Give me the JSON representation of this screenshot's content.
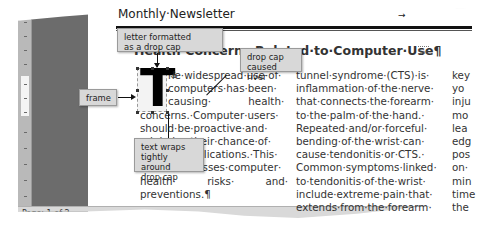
{
  "document": {
    "newsletter_title": "Monthly·Newsletter",
    "tab_marker": "→",
    "heading": "Health·Concerns·Related·to·Computer·Use¶",
    "heading_visible_tail": "to·Computer·Use¶",
    "section_break": "Sec",
    "drop_cap_letter": "T"
  },
  "columns": {
    "col1": [
      "he·widespread·use·of·",
      "computers·has·been·",
      "causing·          health·",
      "concerns.·Computer·users·",
      "should·be·proactive·and·",
      "minimize·their·chance·of·",
      "risk·and·implications.·This·",
      "article·discusses·computer·",
      "health·          risks·          and·",
      "preventions.¶"
    ],
    "col2": [
      "tunnel·syndrome·(CTS)·is·",
      "inflammation·of·the·nerve·",
      "that·connects·the·forearm·",
      "to·the·palm·of·the·hand.·",
      "Repeated·and/or·forceful·",
      "bending·of·the·wrist·can·",
      "cause·tendonitis·or·CTS.·",
      "Common·symptoms·linked·",
      "to·tendonitis·of·the·wrist·",
      "include·extreme·pain·that·",
      "extends·from·the·forearm·"
    ],
    "col3": [
      "key",
      "yo",
      "inju",
      "mo",
      "lea",
      "edg",
      "pos",
      "on·",
      "min",
      "time",
      "the"
    ]
  },
  "callouts": {
    "letter_formatted": [
      "letter formatted",
      "as a drop cap"
    ],
    "drop_cap_river": [
      "drop cap",
      "caused river"
    ],
    "frame": "frame",
    "text_wraps": [
      "text wraps",
      "tightly around",
      "drop cap"
    ]
  },
  "statusbar": {
    "page": "Page: 1 of 2"
  },
  "colors": {
    "ruler": "#b9b9b9",
    "gray_area": "#6c6c6c",
    "callout_bg": "#d8d8d8",
    "text": "#333333"
  }
}
